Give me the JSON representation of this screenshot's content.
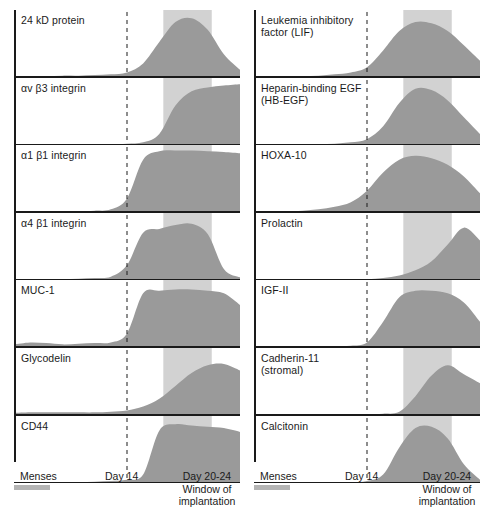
{
  "figure": {
    "colors": {
      "curve_fill": "#9a9a9a",
      "window_band": "#d2d2d2",
      "axis": "#1a1a1a",
      "menses_bar": "#b4b4b4",
      "background": "#ffffff"
    },
    "axis": {
      "x_start_day": 0,
      "x_end_day": 28,
      "day14_line_day": 14,
      "window_start_day": 18.5,
      "window_end_day": 24.5,
      "menses_start_day": 0,
      "menses_end_day": 4.5
    },
    "tick_labels": {
      "menses": "Menses",
      "day14": "Day 14",
      "window": "Day 20-24\nWindow of\nimplantation"
    }
  },
  "chart_data": {
    "type": "area",
    "xlabel": "Cycle day",
    "ylabel": "Relative expression",
    "xlim": [
      0,
      28
    ],
    "ylim": [
      0,
      1
    ],
    "grid": false,
    "legend": "none",
    "annotations": [
      "Menses",
      "Day 14",
      "Day 20-24 Window of implantation"
    ],
    "x": [
      0,
      2,
      4,
      6,
      8,
      10,
      12,
      14,
      16,
      18,
      20,
      22,
      24,
      26,
      28
    ],
    "columns": [
      {
        "name": "left",
        "series": [
          {
            "name": "24 kD protein",
            "label": "24 kD protein",
            "values": [
              0.02,
              0.02,
              0.02,
              0.03,
              0.03,
              0.04,
              0.05,
              0.08,
              0.22,
              0.55,
              0.86,
              0.92,
              0.74,
              0.36,
              0.12
            ]
          },
          {
            "name": "av b3 integrin",
            "label": "αv β3 integrin",
            "values": [
              0.01,
              0.01,
              0.01,
              0.01,
              0.01,
              0.02,
              0.02,
              0.03,
              0.05,
              0.18,
              0.62,
              0.84,
              0.9,
              0.93,
              0.95
            ]
          },
          {
            "name": "a1 b1 integrin",
            "label": "α1 β1 integrin",
            "values": [
              0.01,
              0.01,
              0.01,
              0.02,
              0.02,
              0.03,
              0.05,
              0.22,
              0.82,
              0.95,
              0.96,
              0.96,
              0.95,
              0.94,
              0.92
            ]
          },
          {
            "name": "a4 b1 integrin",
            "label": "α4 β1 integrin",
            "values": [
              0.02,
              0.02,
              0.02,
              0.02,
              0.03,
              0.04,
              0.06,
              0.24,
              0.74,
              0.8,
              0.86,
              0.88,
              0.72,
              0.18,
              0.05
            ]
          },
          {
            "name": "MUC-1",
            "label": "MUC-1",
            "values": [
              0.05,
              0.08,
              0.07,
              0.05,
              0.06,
              0.07,
              0.08,
              0.22,
              0.84,
              0.88,
              0.9,
              0.9,
              0.88,
              0.84,
              0.66
            ]
          },
          {
            "name": "Glycodelin",
            "label": "Glycodelin",
            "values": [
              0.04,
              0.05,
              0.05,
              0.05,
              0.05,
              0.05,
              0.06,
              0.08,
              0.14,
              0.26,
              0.46,
              0.66,
              0.78,
              0.8,
              0.7
            ]
          },
          {
            "name": "CD44",
            "label": "CD44",
            "values": [
              0.02,
              0.02,
              0.02,
              0.02,
              0.02,
              0.03,
              0.04,
              0.06,
              0.14,
              0.82,
              0.92,
              0.9,
              0.88,
              0.86,
              0.8
            ]
          }
        ]
      },
      {
        "name": "right",
        "series": [
          {
            "name": "Leukemia inhibitory factor (LIF)",
            "label": "Leukemia inhibitory\nfactor (LIF)",
            "values": [
              0.01,
              0.01,
              0.01,
              0.02,
              0.03,
              0.05,
              0.08,
              0.16,
              0.42,
              0.72,
              0.86,
              0.84,
              0.72,
              0.5,
              0.26
            ]
          },
          {
            "name": "Heparin-binding EGF (HB-EGF)",
            "label": "Heparin-binding EGF\n(HB-EGF)",
            "values": [
              0.01,
              0.01,
              0.01,
              0.01,
              0.02,
              0.03,
              0.05,
              0.1,
              0.3,
              0.66,
              0.88,
              0.86,
              0.7,
              0.44,
              0.18
            ]
          },
          {
            "name": "HOXA-10",
            "label": "HOXA-10",
            "values": [
              0.02,
              0.02,
              0.02,
              0.03,
              0.05,
              0.09,
              0.16,
              0.34,
              0.62,
              0.82,
              0.88,
              0.84,
              0.74,
              0.56,
              0.3
            ]
          },
          {
            "name": "Prolactin",
            "label": "Prolactin",
            "values": [
              0.01,
              0.01,
              0.01,
              0.01,
              0.01,
              0.01,
              0.02,
              0.02,
              0.04,
              0.08,
              0.16,
              0.3,
              0.56,
              0.82,
              0.62
            ]
          },
          {
            "name": "IGF-II",
            "label": "IGF-II",
            "values": [
              0.01,
              0.01,
              0.01,
              0.01,
              0.02,
              0.02,
              0.03,
              0.08,
              0.4,
              0.78,
              0.88,
              0.88,
              0.84,
              0.7,
              0.4
            ]
          },
          {
            "name": "Cadherin-11 (stromal)",
            "label": "Cadherin-11\n(stromal)",
            "values": [
              0.01,
              0.01,
              0.01,
              0.01,
              0.01,
              0.01,
              0.01,
              0.02,
              0.03,
              0.06,
              0.3,
              0.62,
              0.78,
              0.64,
              0.5
            ]
          },
          {
            "name": "Calcitonin",
            "label": "Calcitonin",
            "values": [
              0.01,
              0.01,
              0.01,
              0.01,
              0.01,
              0.02,
              0.02,
              0.04,
              0.14,
              0.56,
              0.86,
              0.88,
              0.7,
              0.3,
              0.06
            ]
          }
        ]
      }
    ]
  }
}
